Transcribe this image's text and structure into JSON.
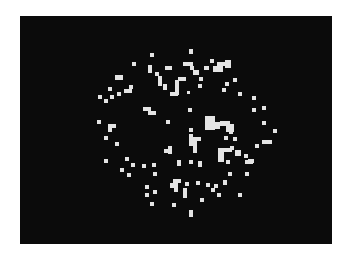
{
  "board": {
    "background": "#0b0b0b",
    "cell_color": "#e4e4e4",
    "frame": {
      "left": 20,
      "top": 16,
      "width": 312,
      "height": 228
    },
    "cells": [
      [
        189,
        49,
        4,
        5
      ],
      [
        150,
        53,
        4,
        4
      ],
      [
        132,
        62,
        4,
        4
      ],
      [
        115,
        75,
        8,
        5
      ],
      [
        148,
        65,
        4,
        8
      ],
      [
        165,
        66,
        7,
        4
      ],
      [
        183,
        62,
        10,
        4
      ],
      [
        190,
        66,
        4,
        4
      ],
      [
        193,
        70,
        6,
        5
      ],
      [
        199,
        77,
        4,
        4
      ],
      [
        210,
        59,
        4,
        4
      ],
      [
        204,
        66,
        5,
        4
      ],
      [
        217,
        62,
        13,
        4
      ],
      [
        213,
        66,
        10,
        6
      ],
      [
        225,
        60,
        6,
        8
      ],
      [
        155,
        72,
        4,
        4
      ],
      [
        158,
        76,
        4,
        10
      ],
      [
        163,
        84,
        4,
        6
      ],
      [
        170,
        92,
        8,
        4
      ],
      [
        175,
        80,
        4,
        15
      ],
      [
        178,
        77,
        8,
        4
      ],
      [
        187,
        91,
        3,
        3
      ],
      [
        198,
        84,
        4,
        4
      ],
      [
        225,
        82,
        4,
        4
      ],
      [
        233,
        78,
        4,
        4
      ],
      [
        222,
        88,
        4,
        4
      ],
      [
        238,
        92,
        4,
        4
      ],
      [
        252,
        96,
        4,
        4
      ],
      [
        108,
        87,
        4,
        4
      ],
      [
        98,
        95,
        4,
        4
      ],
      [
        104,
        99,
        4,
        4
      ],
      [
        110,
        95,
        4,
        4
      ],
      [
        117,
        92,
        4,
        4
      ],
      [
        124,
        89,
        8,
        4
      ],
      [
        129,
        85,
        4,
        4
      ],
      [
        262,
        106,
        4,
        4
      ],
      [
        252,
        108,
        4,
        4
      ],
      [
        143,
        107,
        8,
        4
      ],
      [
        148,
        111,
        8,
        4
      ],
      [
        188,
        108,
        4,
        4
      ],
      [
        97,
        120,
        4,
        4
      ],
      [
        108,
        124,
        4,
        8
      ],
      [
        112,
        124,
        4,
        4
      ],
      [
        166,
        120,
        4,
        4
      ],
      [
        205,
        116,
        10,
        14
      ],
      [
        215,
        122,
        5,
        7
      ],
      [
        220,
        121,
        10,
        5
      ],
      [
        226,
        124,
        8,
        8
      ],
      [
        229,
        130,
        4,
        4
      ],
      [
        262,
        121,
        4,
        4
      ],
      [
        273,
        129,
        4,
        4
      ],
      [
        104,
        136,
        4,
        4
      ],
      [
        115,
        142,
        4,
        4
      ],
      [
        189,
        128,
        4,
        4
      ],
      [
        189,
        134,
        4,
        12
      ],
      [
        193,
        137,
        4,
        16
      ],
      [
        197,
        137,
        4,
        4
      ],
      [
        224,
        136,
        4,
        4
      ],
      [
        233,
        137,
        4,
        4
      ],
      [
        262,
        140,
        10,
        4
      ],
      [
        255,
        144,
        4,
        4
      ],
      [
        164,
        149,
        8,
        4
      ],
      [
        168,
        146,
        4,
        8
      ],
      [
        218,
        148,
        14,
        4
      ],
      [
        218,
        152,
        6,
        10
      ],
      [
        230,
        146,
        4,
        4
      ],
      [
        235,
        150,
        6,
        6
      ],
      [
        244,
        154,
        4,
        4
      ],
      [
        248,
        159,
        6,
        4
      ],
      [
        104,
        159,
        4,
        4
      ],
      [
        125,
        157,
        4,
        4
      ],
      [
        131,
        163,
        4,
        4
      ],
      [
        142,
        164,
        4,
        4
      ],
      [
        152,
        163,
        4,
        4
      ],
      [
        177,
        160,
        4,
        6
      ],
      [
        189,
        160,
        4,
        4
      ],
      [
        198,
        161,
        4,
        6
      ],
      [
        226,
        160,
        4,
        4
      ],
      [
        245,
        160,
        8,
        4
      ],
      [
        120,
        168,
        4,
        4
      ],
      [
        127,
        173,
        4,
        4
      ],
      [
        153,
        172,
        4,
        4
      ],
      [
        228,
        172,
        4,
        4
      ],
      [
        245,
        172,
        4,
        4
      ],
      [
        173,
        179,
        8,
        4
      ],
      [
        170,
        183,
        8,
        5
      ],
      [
        185,
        182,
        4,
        4
      ],
      [
        196,
        181,
        4,
        4
      ],
      [
        206,
        183,
        4,
        4
      ],
      [
        214,
        184,
        4,
        4
      ],
      [
        223,
        180,
        4,
        5
      ],
      [
        145,
        185,
        4,
        4
      ],
      [
        153,
        190,
        4,
        4
      ],
      [
        174,
        188,
        4,
        4
      ],
      [
        211,
        188,
        4,
        4
      ],
      [
        145,
        193,
        4,
        4
      ],
      [
        183,
        188,
        4,
        8
      ],
      [
        183,
        192,
        4,
        6
      ],
      [
        217,
        193,
        4,
        4
      ],
      [
        238,
        193,
        4,
        4
      ],
      [
        150,
        202,
        4,
        4
      ],
      [
        172,
        203,
        4,
        4
      ],
      [
        200,
        198,
        4,
        4
      ],
      [
        189,
        210,
        4,
        7
      ]
    ]
  }
}
